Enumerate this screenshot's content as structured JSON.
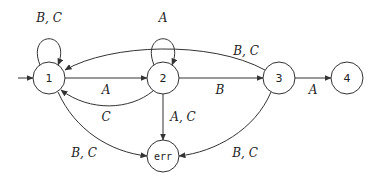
{
  "diagram": {
    "type": "finite-state-automaton",
    "nodes": [
      {
        "id": "1",
        "label": "1",
        "x": 49,
        "y": 78,
        "initial": true
      },
      {
        "id": "2",
        "label": "2",
        "x": 163,
        "y": 78
      },
      {
        "id": "3",
        "label": "3",
        "x": 279,
        "y": 78
      },
      {
        "id": "4",
        "label": "4",
        "x": 347,
        "y": 78
      },
      {
        "id": "err",
        "label": "err",
        "x": 163,
        "y": 156
      }
    ],
    "edges": [
      {
        "from": "1",
        "to": "1",
        "label": "B, C"
      },
      {
        "from": "2",
        "to": "2",
        "label": "A"
      },
      {
        "from": "1",
        "to": "2",
        "label": "A"
      },
      {
        "from": "2",
        "to": "1",
        "label": "C"
      },
      {
        "from": "3",
        "to": "1",
        "label": "B, C"
      },
      {
        "from": "2",
        "to": "3",
        "label": "B"
      },
      {
        "from": "3",
        "to": "4",
        "label": "A"
      },
      {
        "from": "2",
        "to": "err",
        "label": "A, C"
      },
      {
        "from": "1",
        "to": "err",
        "label": "B, C"
      },
      {
        "from": "3",
        "to": "err",
        "label": "B, C"
      }
    ]
  }
}
